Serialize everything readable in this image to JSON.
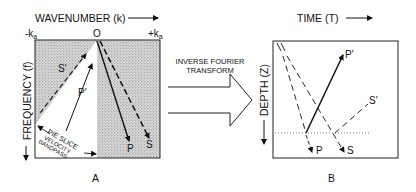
{
  "panel_a": {
    "x_axis_label": "WAVENUMBER (k)",
    "y_axis_label": "FREQUENCY (f)",
    "tick_left": "-k",
    "tick_left_sub": "a",
    "tick_center": "O",
    "tick_right": "+k",
    "tick_right_sub": "a",
    "s_prime_label": "S'",
    "p_prime_label": "P'",
    "p_label": "P",
    "s_label": "S",
    "pie_line1": "PIE SLICE",
    "pie_line2": "VELOCITY",
    "pie_line3": "BANDPASS",
    "panel_label": "A"
  },
  "transform": {
    "line1": "INVERSE FOURIER",
    "line2": "TRANSFORM"
  },
  "panel_b": {
    "x_axis_label": "TIME (T)",
    "y_axis_label": "DEPTH (Z)",
    "p_prime_label": "P'",
    "s_prime_label": "S'",
    "p_label": "P",
    "s_label": "S",
    "panel_label": "B"
  }
}
